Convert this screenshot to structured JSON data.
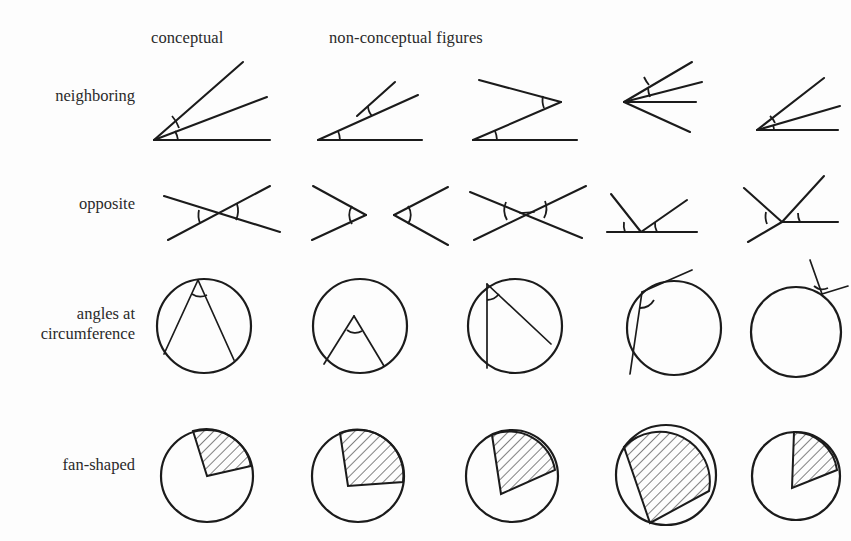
{
  "figure": {
    "caption_headers": {
      "conceptual": "conceptual",
      "non_conceptual": "non-conceptual figures"
    },
    "row_labels": [
      "neighboring",
      "opposite",
      "angles at\ncircumference",
      "fan-shaped"
    ],
    "columns": [
      {
        "index": 1,
        "type": "conceptual"
      },
      {
        "index": 2,
        "type": "non-conceptual"
      },
      {
        "index": 3,
        "type": "non-conceptual"
      },
      {
        "index": 4,
        "type": "non-conceptual"
      },
      {
        "index": 5,
        "type": "non-conceptual"
      }
    ],
    "ink_color": "#1b1b1b",
    "background_color": "#ffffff",
    "rows": [
      {
        "name": "neighboring",
        "cells": [
          {
            "name": "neighboring-conceptual",
            "desc": "single vertex lower-left, horizontal ray plus two upward rays, two angle arcs"
          },
          {
            "name": "neighboring-split-vertices",
            "desc": "two separate vertices, one on the baseline and one raised"
          },
          {
            "name": "neighboring-zigzag",
            "desc": "zigzag Z shape, vertex on baseline and vertex at right"
          },
          {
            "name": "neighboring-fan-four-rays",
            "desc": "four rays from one left vertex, two arcs"
          },
          {
            "name": "neighboring-compressed",
            "desc": "compact version of the conceptual figure, three rays"
          }
        ]
      },
      {
        "name": "opposite",
        "cells": [
          {
            "name": "opposite-conceptual",
            "desc": "two lines crossing in an X, arcs on left and right vertical angles"
          },
          {
            "name": "opposite-separated-vs",
            "desc": "two V shapes facing each other, not crossing"
          },
          {
            "name": "opposite-offset-crossing",
            "desc": "bowtie with two distinct crossing points"
          },
          {
            "name": "opposite-on-baseline",
            "desc": "two rays rising from a point on a horizontal line, two arcs"
          },
          {
            "name": "opposite-three-rays",
            "desc": "vertex with horizontal ray, upward rays and a through line"
          }
        ]
      },
      {
        "name": "angles at circumference",
        "cells": [
          {
            "name": "circumference-conceptual",
            "desc": "inscribed angle, apex on circle top, two chords, arc at apex"
          },
          {
            "name": "circumference-apex-inside",
            "desc": "apex inside the circle, legs reaching the bottom arc"
          },
          {
            "name": "circumference-vertical-chord",
            "desc": "apex on top, vertical chord and oblique chord"
          },
          {
            "name": "circumference-ray-outside",
            "desc": "apex on circle, one chord inside and one ray outside"
          },
          {
            "name": "circumference-both-rays-outside",
            "desc": "apex on circle, both rays outside the circle"
          }
        ]
      },
      {
        "name": "fan-shaped",
        "cells": [
          {
            "name": "fan-conceptual",
            "desc": "pie with hatched sector, apex at centre, upper-right sector"
          },
          {
            "name": "fan-apex-offset",
            "desc": "pie with hatched sector, apex offset from centre, larger sector"
          },
          {
            "name": "fan-narrow-sector",
            "desc": "pie with narrow hatched sector, apex below centre"
          },
          {
            "name": "fan-large-sector",
            "desc": "pie with large hatched sector, apex at lower-left edge"
          },
          {
            "name": "fan-small-sector",
            "desc": "pie with small narrow hatched sector near centre-right"
          }
        ]
      }
    ]
  }
}
